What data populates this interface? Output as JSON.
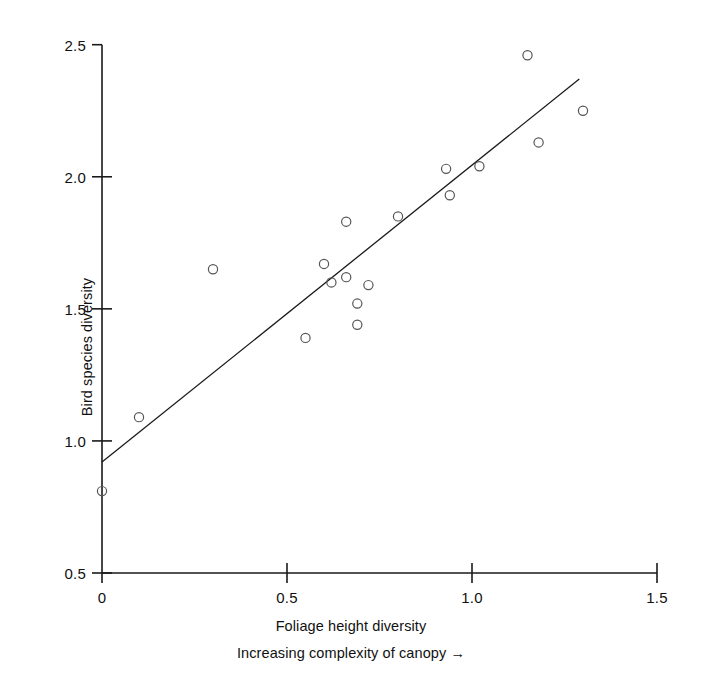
{
  "figure": {
    "background_color": "#ffffff",
    "ink_color": "#1a1a1a",
    "marker_color": "#555555"
  },
  "axes": {
    "y_title": "Bird species diversity",
    "x_title": "Foliage height diversity",
    "x_subtitle": "Increasing complexity of canopy →"
  },
  "chart_data": {
    "type": "scatter",
    "title": "",
    "subtitle": "",
    "xlabel": "Foliage height diversity",
    "xlabel_secondary": "Increasing complexity of canopy →",
    "ylabel": "Bird species diversity",
    "xlim": [
      0,
      1.5
    ],
    "ylim": [
      0.5,
      2.5
    ],
    "xticks": [
      0,
      0.5,
      1.0,
      1.5
    ],
    "xtick_labels": [
      "0",
      "0.5",
      "1.0",
      "1.5"
    ],
    "yticks": [
      0.5,
      1.0,
      1.5,
      2.0,
      2.5
    ],
    "ytick_labels": [
      "0.5",
      "1.0",
      "1.5",
      "2.0",
      "2.5"
    ],
    "grid": false,
    "legend": null,
    "marker_style": "open-circle",
    "points": [
      {
        "x": 0.0,
        "y": 0.81
      },
      {
        "x": 0.1,
        "y": 1.09
      },
      {
        "x": 0.3,
        "y": 1.65
      },
      {
        "x": 0.55,
        "y": 1.39
      },
      {
        "x": 0.6,
        "y": 1.67
      },
      {
        "x": 0.62,
        "y": 1.6
      },
      {
        "x": 0.66,
        "y": 1.83
      },
      {
        "x": 0.66,
        "y": 1.62
      },
      {
        "x": 0.69,
        "y": 1.52
      },
      {
        "x": 0.69,
        "y": 1.44
      },
      {
        "x": 0.72,
        "y": 1.59
      },
      {
        "x": 0.8,
        "y": 1.85
      },
      {
        "x": 0.93,
        "y": 2.03
      },
      {
        "x": 0.94,
        "y": 1.93
      },
      {
        "x": 1.02,
        "y": 2.04
      },
      {
        "x": 1.15,
        "y": 2.46
      },
      {
        "x": 1.18,
        "y": 2.13
      },
      {
        "x": 1.3,
        "y": 2.25
      }
    ],
    "fit_line": {
      "type": "linear-regression",
      "x_start": 0.0,
      "y_start": 0.92,
      "x_end": 1.29,
      "y_end": 2.37,
      "slope": 1.124,
      "intercept": 0.92
    }
  }
}
